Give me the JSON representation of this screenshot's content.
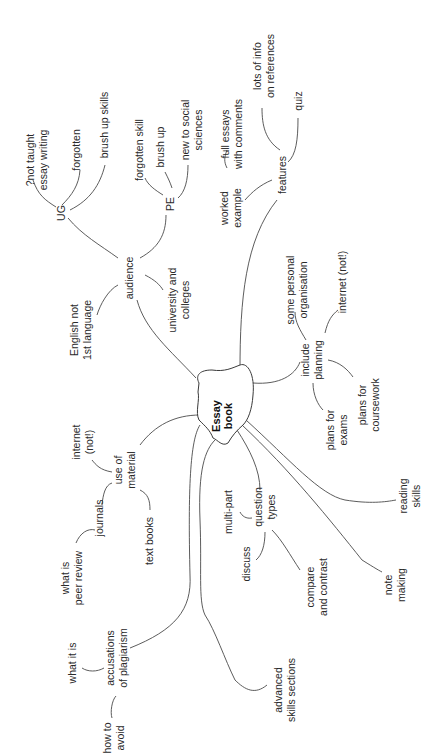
{
  "mindmap": {
    "center": {
      "line1": "Essay",
      "line2": "book"
    },
    "audience": {
      "label": "audience",
      "ug": {
        "label": "UG",
        "not_taught": {
          "line1": "?not taught",
          "line2": "essay writing"
        },
        "forgotten": "forgotten",
        "brush_up_skills": "brush up skills"
      },
      "pe": {
        "label": "PE",
        "forgotten_skill": "forgotten skill",
        "brush_up": "brush up",
        "new_to_social": {
          "line1": "new to social",
          "line2": "sciences"
        }
      },
      "english": {
        "line1": "English not",
        "line2": "1st language"
      },
      "university": {
        "line1": "university and",
        "line2": "colleges"
      }
    },
    "features": {
      "label": "features",
      "worked_example": {
        "line1": "worked",
        "line2": "example"
      },
      "full_essays": {
        "line1": "full essays",
        "line2": "with comments"
      },
      "lots_of_info": {
        "line1": "lots of info",
        "line2": "on references"
      },
      "quiz": "quiz"
    },
    "include_planning": {
      "line1": "include",
      "line2": "planning",
      "personal_org": {
        "line1": "some personal",
        "line2": "organisation"
      },
      "internet_not": "internet (not!)",
      "plans_coursework": {
        "line1": "plans for",
        "line2": "coursework"
      },
      "plans_exams": {
        "line1": "plans for",
        "line2": "exams"
      }
    },
    "use_of_material": {
      "line1": "use of",
      "line2": "material",
      "internet_not": {
        "line1": "internet",
        "line2": "(not!)"
      },
      "journals": "journals",
      "peer_review": {
        "line1": "what is",
        "line2": "peer review"
      },
      "text_books": "text books"
    },
    "plagiarism": {
      "line1": "accusations",
      "line2": "of  plagiarism",
      "what_it_is": "what it is",
      "how_to_avoid": {
        "line1": "how to",
        "line2": "avoid"
      }
    },
    "question_types": {
      "line1": "question",
      "line2": "types",
      "multi_part": "multi-part",
      "discuss": "discuss",
      "compare": {
        "line1": "compare",
        "line2": "and contrast"
      }
    },
    "advanced": {
      "line1": "advanced",
      "line2": "skills sections"
    },
    "note_making": {
      "line1": "note",
      "line2": "making"
    },
    "reading_skills": {
      "line1": "reading",
      "line2": "skills"
    }
  }
}
